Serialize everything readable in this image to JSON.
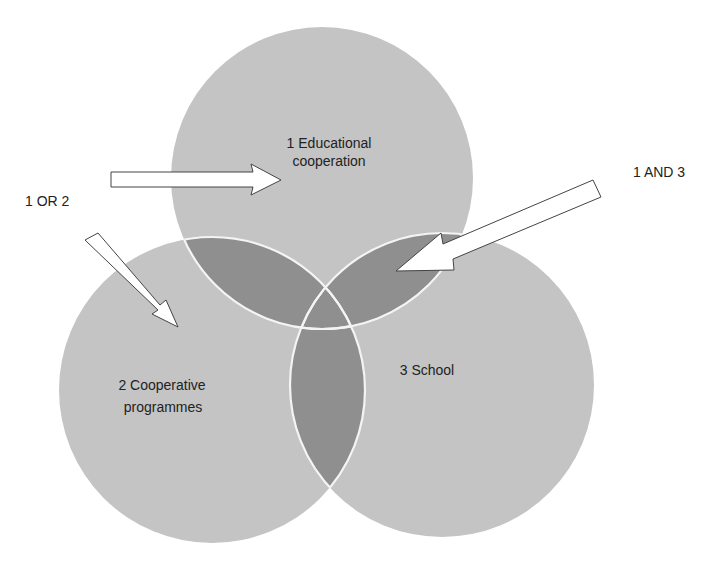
{
  "diagram": {
    "type": "venn",
    "colors": {
      "set_fill": "#c4c4c4",
      "pair_overlap_fill": "#8f8f8f",
      "triple_overlap_fill": "#8f8f8f",
      "outline": "#f4f4f4",
      "arrow_fill": "#ffffff",
      "arrow_stroke": "#444444",
      "text": "#222222"
    },
    "sets": [
      {
        "id": "1",
        "line1": "1 Educational",
        "line2": "cooperation"
      },
      {
        "id": "2",
        "line1": "2 Cooperative",
        "line2": "programmes"
      },
      {
        "id": "3",
        "line1": "3 School"
      }
    ],
    "annotations": [
      {
        "id": "or",
        "label": "1 OR 2"
      },
      {
        "id": "and",
        "label": "1 AND 3"
      }
    ]
  }
}
